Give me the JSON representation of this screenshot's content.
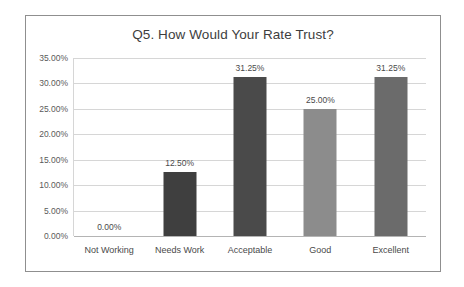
{
  "chart_data": {
    "type": "bar",
    "title": "Q5. How Would Your Rate Trust?",
    "xlabel": "",
    "ylabel": "",
    "categories": [
      "Not Working",
      "Needs  Work",
      "Acceptable",
      "Good",
      "Excellent"
    ],
    "values": [
      0.0,
      12.5,
      31.25,
      25.0,
      31.25
    ],
    "data_labels": [
      "0.00%",
      "12.50%",
      "31.25%",
      "25.00%",
      "31.25%"
    ],
    "bar_colors": [
      "#595959",
      "#3f3f3f",
      "#4a4a4a",
      "#8c8c8c",
      "#6b6b6b"
    ],
    "ylim": [
      0,
      35
    ],
    "ytick_values": [
      35.0,
      30.0,
      25.0,
      20.0,
      15.0,
      10.0,
      5.0,
      0.0
    ],
    "ytick_labels": [
      "35.00%",
      "30.00%",
      "25.00%",
      "20.00%",
      "15.00%",
      "10.00%",
      "5.00%",
      "0.00%"
    ],
    "grid": true,
    "gridline_color": "#d6d6d6",
    "legend": false,
    "plot_background": "#ffffff",
    "border_color": "#8f8f8f"
  }
}
